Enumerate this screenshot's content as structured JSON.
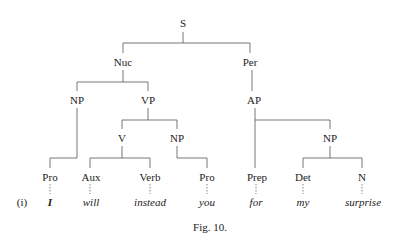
{
  "figure": {
    "example_label": "(i)",
    "caption": "Fig. 10."
  },
  "tree": {
    "nodes": [
      {
        "id": "S",
        "label": "S"
      },
      {
        "id": "Nuc",
        "label": "Nuc",
        "parent": "S"
      },
      {
        "id": "Per",
        "label": "Per",
        "parent": "S"
      },
      {
        "id": "NP1",
        "label": "NP",
        "parent": "Nuc"
      },
      {
        "id": "VP",
        "label": "VP",
        "parent": "Nuc"
      },
      {
        "id": "AP",
        "label": "AP",
        "parent": "Per"
      },
      {
        "id": "V",
        "label": "V",
        "parent": "VP"
      },
      {
        "id": "NP2",
        "label": "NP",
        "parent": "VP"
      },
      {
        "id": "NP3",
        "label": "NP",
        "parent": "AP"
      },
      {
        "id": "Pro1",
        "label": "Pro",
        "parent": "NP1"
      },
      {
        "id": "Aux",
        "label": "Aux",
        "parent": "V"
      },
      {
        "id": "Verb",
        "label": "Verb",
        "parent": "V"
      },
      {
        "id": "Pro2",
        "label": "Pro",
        "parent": "NP2"
      },
      {
        "id": "Prep",
        "label": "Prep",
        "parent": "AP"
      },
      {
        "id": "Det",
        "label": "Det",
        "parent": "NP3"
      },
      {
        "id": "N",
        "label": "N",
        "parent": "NP3"
      }
    ],
    "words": [
      {
        "for": "Pro1",
        "text": "I"
      },
      {
        "for": "Aux",
        "text": "will"
      },
      {
        "for": "Verb",
        "text": "instead"
      },
      {
        "for": "Pro2",
        "text": "you"
      },
      {
        "for": "Prep",
        "text": "for"
      },
      {
        "for": "Det",
        "text": "my"
      },
      {
        "for": "N",
        "text": "surprise"
      }
    ]
  }
}
